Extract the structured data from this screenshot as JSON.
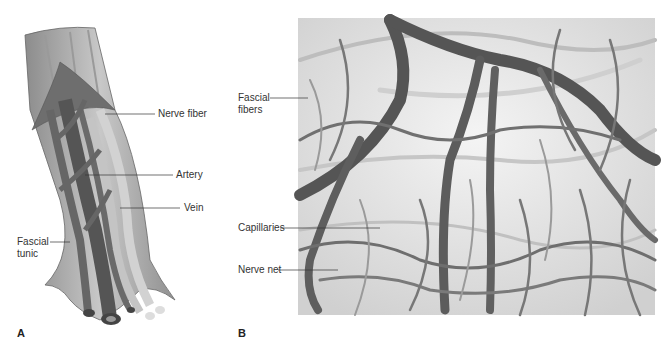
{
  "figure": {
    "panels": [
      {
        "letter": "A",
        "labels": {
          "nerve_fiber": "Nerve fiber",
          "artery": "Artery",
          "vein": "Vein",
          "fascial_tunic": "Fascial\ntunic"
        }
      },
      {
        "letter": "B",
        "labels": {
          "fascial_fibers": "Fascial\nfibers",
          "capillaries": "Capillaries",
          "nerve_net": "Nerve net"
        }
      }
    ],
    "colors": {
      "vessel_dark": "#5a5a5a",
      "vessel_mid": "#7a7a7a",
      "nerve_light": "#bdbdbd",
      "tunic": "#a8a8a8",
      "background_b": "#e4e4e4"
    }
  }
}
